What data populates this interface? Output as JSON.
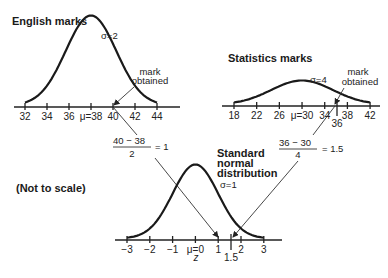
{
  "diagram": {
    "note": "(Not to scale)",
    "english": {
      "title": "English marks",
      "sigma_label": "σ=2",
      "mean": 38,
      "sd": 2,
      "ticks": [
        "32",
        "34",
        "36",
        "μ=38",
        "40",
        "42",
        "44"
      ],
      "tick_values": [
        32,
        34,
        36,
        38,
        40,
        42,
        44
      ],
      "mark_label_line1": "mark",
      "mark_label_line2": "obtained",
      "mark": 40,
      "formula_num": "40 − 38",
      "formula_den": "2",
      "formula_result": "= 1"
    },
    "statistics": {
      "title": "Statistics marks",
      "sigma_label": "σ=4",
      "mean": 30,
      "sd": 4,
      "ticks": [
        "18",
        "22",
        "26",
        "μ=30",
        "34",
        "38",
        "42"
      ],
      "tick_values": [
        18,
        22,
        26,
        30,
        34,
        38,
        42
      ],
      "mark_tick": "36",
      "mark": 36,
      "mark_label_line1": "mark",
      "mark_label_line2": "obtained",
      "formula_num": "36 − 30",
      "formula_den": "4",
      "formula_result": "= 1.5"
    },
    "standard": {
      "title_line1": "Standard",
      "title_line2": "normal",
      "title_line3": "distribution",
      "sigma_label": "σ=1",
      "ticks": [
        "−3",
        "−2",
        "−1",
        "μ=0",
        "1",
        "2",
        "3"
      ],
      "tick_values": [
        -3,
        -2,
        -1,
        0,
        1,
        2,
        3
      ],
      "mark_tick": "1.5",
      "axis_label": "z"
    }
  }
}
